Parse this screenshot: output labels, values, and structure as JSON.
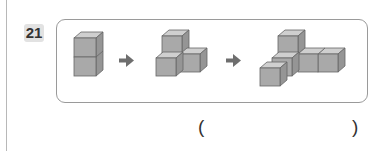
{
  "question": {
    "number": "21",
    "sequence": [
      {
        "shape": "cube-stack-2",
        "cubes": 2
      },
      {
        "shape": "arrow-right"
      },
      {
        "shape": "cube-l-3",
        "cubes": 3
      },
      {
        "shape": "arrow-right"
      },
      {
        "shape": "cube-t-5",
        "cubes": 5
      }
    ],
    "answer_open": "(",
    "answer_close": ")",
    "answer_value": ""
  },
  "colors": {
    "cube_front": "#a9a9a9",
    "cube_top": "#cfcfcf",
    "cube_side": "#959595",
    "arrow": "#6e6e6e",
    "badge_bg": "#e2e2e2",
    "frame_border": "#9a9a9a"
  }
}
